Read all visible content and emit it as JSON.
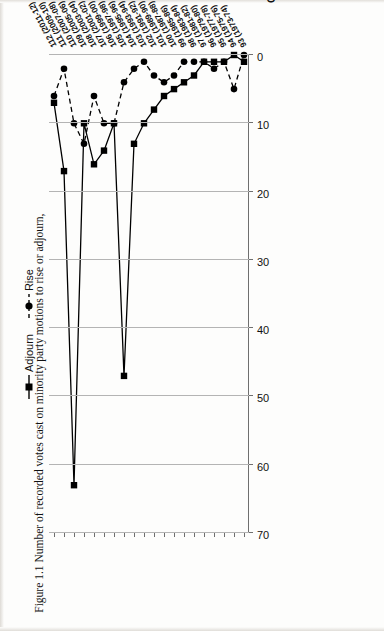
{
  "figure": {
    "caption": "Figure 1.1 Number of recorded votes cast on minority party motions to rise or adjourn,"
  },
  "chart_data": {
    "type": "line",
    "title": "",
    "xlabel": "Congress (Years)",
    "ylabel": "",
    "ylim": [
      0,
      70
    ],
    "yticks": [
      "0",
      "10",
      "20",
      "30",
      "40",
      "50",
      "60",
      "70"
    ],
    "grid": true,
    "legend_position": "top",
    "orientation": "rotated-90-ccw",
    "categories": [
      "112 (2011-12)",
      "111 (2009-10)",
      "110 (2007-08)",
      "109 (2005-06)",
      "108 (2003-04)",
      "107 (2001-02)",
      "106 (1999-00)",
      "105 (1997-98)",
      "104 (1995-96)",
      "103 (1993-94)",
      "102 (1991-92)",
      "101 (1989-90)",
      "100 (1987-88)",
      "99 (1985-86)",
      "98 (1983-84)",
      "97 (1981-82)",
      "96 (1979-80)",
      "95 (1977-78)",
      "94 (1975-76)",
      "93 (1973-74)"
    ],
    "series": [
      {
        "name": "Adjourn",
        "marker": "square",
        "linestyle": "solid",
        "color": "#000000",
        "values": [
          7,
          17,
          63,
          10,
          16,
          14,
          10,
          47,
          13,
          10,
          8,
          6,
          5,
          4,
          3,
          1,
          1,
          1,
          0,
          1
        ]
      },
      {
        "name": "Rise",
        "marker": "circle",
        "linestyle": "dashed",
        "color": "#000000",
        "values": [
          6,
          2,
          10,
          13,
          6,
          10,
          10,
          4,
          2,
          1,
          3,
          4,
          3,
          1,
          1,
          1,
          2,
          1,
          5,
          0
        ]
      }
    ]
  },
  "legend": {
    "items": [
      {
        "label": "Adjourn",
        "marker": "square-marker-icon"
      },
      {
        "label": "Rise",
        "marker": "circle-marker-icon"
      }
    ]
  }
}
